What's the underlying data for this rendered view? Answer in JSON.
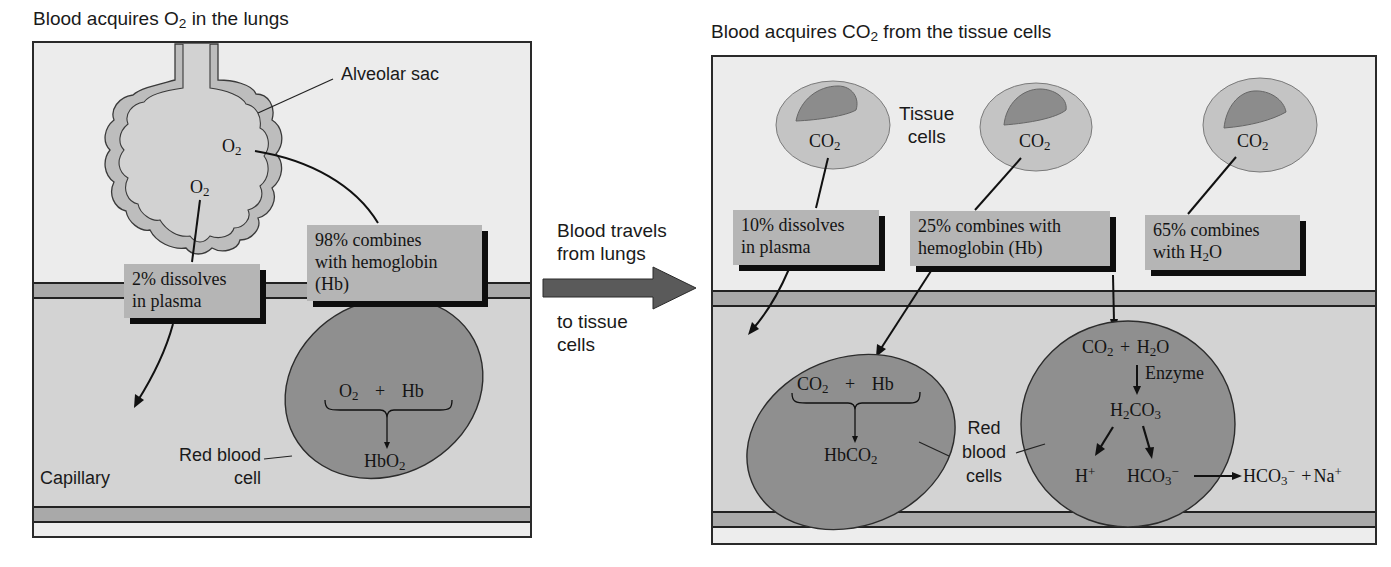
{
  "left_panel": {
    "title_prefix": "Blood acquires O",
    "title_sub": "2",
    "title_suffix": " in the lungs",
    "alveolar_sac_label": "Alveolar sac",
    "o2_upper": {
      "base": "O",
      "sub": "2"
    },
    "o2_lower": {
      "base": "O",
      "sub": "2"
    },
    "box_dissolve": {
      "line1": "2% dissolves",
      "line2": "in plasma"
    },
    "box_hemoglobin": {
      "line1": "98% combines",
      "line2": "with hemoglobin",
      "line3": "(Hb)"
    },
    "reaction": {
      "reactant1_base": "O",
      "reactant1_sub": "2",
      "plus": "+",
      "reactant2": "Hb",
      "product_base": "HbO",
      "product_sub": "2"
    },
    "rbc_label": {
      "line1": "Red blood",
      "line2": "cell"
    },
    "capillary_label": "Capillary"
  },
  "middle": {
    "line1": "Blood travels",
    "line2": "from lungs",
    "line3": "to tissue",
    "line4": "cells"
  },
  "right_panel": {
    "title_prefix": "Blood acquires CO",
    "title_sub": "2",
    "title_suffix": " from the tissue cells",
    "tissue_label": {
      "line1": "Tissue",
      "line2": "cells"
    },
    "tissue_cells": [
      {
        "base": "CO",
        "sub": "2"
      },
      {
        "base": "CO",
        "sub": "2"
      },
      {
        "base": "CO",
        "sub": "2"
      }
    ],
    "box_dissolve": {
      "line1": "10% dissolves",
      "line2": "in plasma"
    },
    "box_hemoglobin": {
      "line1": "25% combines with",
      "line2": "hemoglobin (Hb)"
    },
    "box_water": {
      "line1": "65% combines",
      "line2_prefix": "with H",
      "line2_sub": "2",
      "line2_suffix": "O"
    },
    "reaction_hb": {
      "reactant1_base": "CO",
      "reactant1_sub": "2",
      "plus": "+",
      "reactant2": "Hb",
      "product_base": "HbCO",
      "product_sub": "2"
    },
    "rbc_label": {
      "line1": "Red",
      "line2": "blood",
      "line3": "cells"
    },
    "reaction_water": {
      "co2_base": "CO",
      "co2_sub": "2",
      "plus": "+",
      "h2o_prefix": "H",
      "h2o_sub": "2",
      "h2o_suffix": "O",
      "enzyme": "Enzyme",
      "h2co3_a": "H",
      "h2co3_sub1": "2",
      "h2co3_b": "CO",
      "h2co3_sub2": "3",
      "hplus_base": "H",
      "hplus_sup": "+",
      "bicarb_base": "HCO",
      "bicarb_sub": "3",
      "bicarb_sup": "−",
      "out_base": "HCO",
      "out_sub": "3",
      "out_sup": "−",
      "out_plus": "+",
      "na_base": "Na",
      "na_sup": "+"
    }
  },
  "colors": {
    "panel_bg": "#ececec",
    "vessel_bg": "#d3d3d3",
    "band": "#a9a9a9",
    "rbc": "#8f8f8f",
    "tissue_cell": "#c4c4c4",
    "nucleus": "#8c8c8c",
    "label_box": "#b5b5b5",
    "arrow": "#5a5a5a"
  }
}
